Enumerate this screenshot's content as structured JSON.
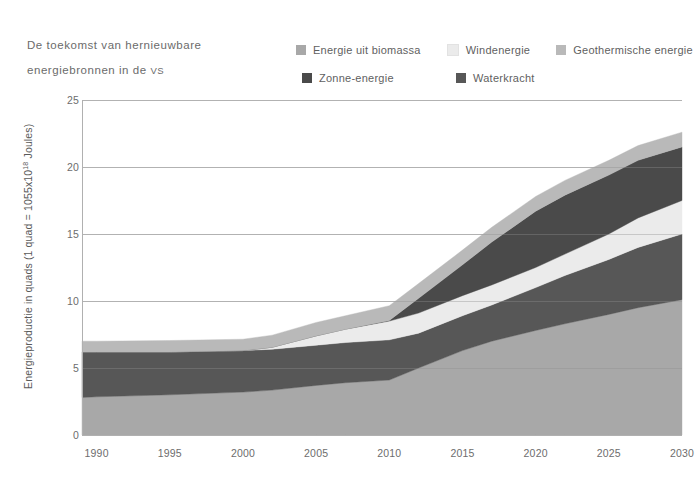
{
  "title": {
    "line1": "De toekomst van hernieuwbare",
    "line2_pre": "energiebronnen in de ",
    "line2_caps": "VS"
  },
  "legend": {
    "row1": [
      {
        "label": "Energie uit biomassa",
        "color": "#a8a8a8",
        "name": "biomass"
      },
      {
        "label": "Windenergie",
        "color": "#ebebeb",
        "name": "wind"
      },
      {
        "label": "Geothermische energie",
        "color": "#b9b9b9",
        "name": "geothermal"
      }
    ],
    "row2": [
      {
        "label": "Zonne-energie",
        "color": "#4a4a4a",
        "name": "solar"
      },
      {
        "label": "Waterkracht",
        "color": "#575757",
        "name": "hydro"
      }
    ]
  },
  "chart_data": {
    "type": "area",
    "title": "De toekomst van hernieuwbare energiebronnen in de VS",
    "xlabel": "",
    "ylabel": "Energieproductie in quads (1 quad = 1055x10¹⁸ Joules)",
    "ylabel_pre": "Energieproductie in quads (1 quad = 1055x10",
    "ylabel_sup": "18",
    "ylabel_post": " Joules)",
    "stacked": true,
    "grid": true,
    "legend_position": "top-right",
    "xlim": [
      1989,
      2030
    ],
    "ylim": [
      0,
      25
    ],
    "yticks": [
      25,
      20,
      15,
      10,
      5,
      0
    ],
    "xticks": [
      1990,
      1995,
      2000,
      2005,
      2010,
      2015,
      2020,
      2025,
      2030
    ],
    "x": [
      1989,
      1990,
      1995,
      2000,
      2002,
      2005,
      2007,
      2010,
      2012,
      2015,
      2017,
      2020,
      2022,
      2025,
      2027,
      2030
    ],
    "series": [
      {
        "name": "Energie uit biomassa",
        "color": "#a8a8a8",
        "values": [
          2.8,
          2.85,
          3.0,
          3.2,
          3.35,
          3.7,
          3.9,
          4.1,
          5.0,
          6.3,
          7.0,
          7.8,
          8.3,
          9.0,
          9.5,
          10.1
        ]
      },
      {
        "name": "Waterkracht",
        "color": "#575757",
        "values": [
          3.4,
          3.35,
          3.2,
          3.1,
          3.05,
          3.0,
          3.0,
          3.0,
          2.6,
          2.6,
          2.7,
          3.2,
          3.6,
          4.1,
          4.5,
          4.9
        ]
      },
      {
        "name": "Windenergie",
        "color": "#ebebeb",
        "values": [
          0.0,
          0.0,
          0.0,
          0.0,
          0.15,
          0.7,
          1.0,
          1.4,
          1.5,
          1.5,
          1.5,
          1.5,
          1.6,
          1.9,
          2.2,
          2.5
        ]
      },
      {
        "name": "Zonne-energie",
        "color": "#4a4a4a",
        "values": [
          0.0,
          0.0,
          0.0,
          0.0,
          0.0,
          0.0,
          0.0,
          0.05,
          1.1,
          2.3,
          3.2,
          4.2,
          4.4,
          4.4,
          4.3,
          4.0
        ]
      },
      {
        "name": "Geothermische energie",
        "color": "#b9b9b9",
        "values": [
          0.8,
          0.8,
          0.85,
          0.85,
          0.9,
          1.0,
          1.0,
          1.1,
          1.1,
          1.1,
          1.1,
          1.1,
          1.1,
          1.1,
          1.1,
          1.1
        ]
      }
    ],
    "totals": [
      7.0,
      7.0,
      7.05,
      7.15,
      7.45,
      8.4,
      8.9,
      9.65,
      11.3,
      13.8,
      15.5,
      17.8,
      19.0,
      20.5,
      21.6,
      22.6
    ],
    "axis_color": "#b0b0b0",
    "grid_color": "#c9c9c9",
    "plot_bg": "#ffffff"
  }
}
